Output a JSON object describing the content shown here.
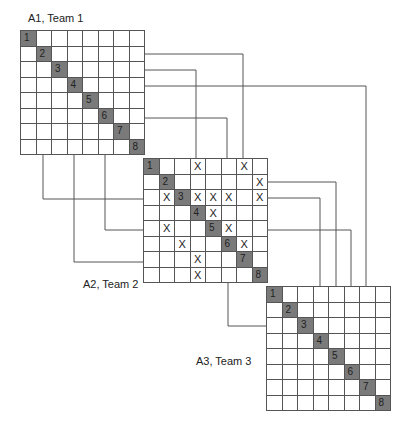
{
  "diagram": {
    "type": "coupled-dsm",
    "cell_size": 15.5,
    "matrices": [
      {
        "id": "A1",
        "label": "A1, Team 1",
        "x": 20,
        "y": 30,
        "size": 8,
        "diagonal": [
          "1",
          "2",
          "3",
          "4",
          "5",
          "6",
          "7",
          "8"
        ],
        "marks": [],
        "label_pos": {
          "x": 28,
          "y": 12
        }
      },
      {
        "id": "A2",
        "label": "A2, Team 2",
        "x": 143,
        "y": 158,
        "size": 8,
        "diagonal": [
          "1",
          "2",
          "3",
          "4",
          "5",
          "6",
          "7",
          "8"
        ],
        "marks": [
          [
            1,
            4
          ],
          [
            1,
            7
          ],
          [
            2,
            8
          ],
          [
            3,
            2
          ],
          [
            3,
            4
          ],
          [
            3,
            5
          ],
          [
            3,
            6
          ],
          [
            3,
            8
          ],
          [
            4,
            5
          ],
          [
            5,
            2
          ],
          [
            5,
            6
          ],
          [
            6,
            3
          ],
          [
            6,
            7
          ],
          [
            7,
            4
          ],
          [
            8,
            4
          ]
        ],
        "label_pos": {
          "x": 83,
          "y": 278
        }
      },
      {
        "id": "A3",
        "label": "A3, Team 3",
        "x": 266,
        "y": 286,
        "size": 8,
        "diagonal": [
          "1",
          "2",
          "3",
          "4",
          "5",
          "6",
          "7",
          "8"
        ],
        "marks": [],
        "label_pos": {
          "x": 196,
          "y": 355
        }
      }
    ],
    "mark_symbol": "X",
    "connectors": [
      [
        [
          144,
          54
        ],
        [
          243,
          54
        ],
        [
          243,
          158
        ]
      ],
      [
        [
          144,
          70
        ],
        [
          196,
          70
        ],
        [
          196,
          158
        ]
      ],
      [
        [
          144,
          86
        ],
        [
          366,
          86
        ],
        [
          366,
          286
        ]
      ],
      [
        [
          144,
          118
        ],
        [
          227,
          118
        ],
        [
          227,
          158
        ]
      ],
      [
        [
          43,
          155
        ],
        [
          43,
          199
        ],
        [
          143,
          199
        ]
      ],
      [
        [
          74,
          155
        ],
        [
          74,
          262
        ],
        [
          143,
          262
        ]
      ],
      [
        [
          105,
          155
        ],
        [
          105,
          230
        ],
        [
          143,
          230
        ]
      ],
      [
        [
          267,
          182
        ],
        [
          336,
          182
        ],
        [
          336,
          286
        ]
      ],
      [
        [
          267,
          198
        ],
        [
          320,
          198
        ],
        [
          320,
          286
        ]
      ],
      [
        [
          267,
          230
        ],
        [
          351,
          230
        ],
        [
          351,
          286
        ]
      ],
      [
        [
          228,
          282
        ],
        [
          228,
          326
        ],
        [
          266,
          326
        ]
      ]
    ],
    "colors": {
      "line": "#555555",
      "diagonal_fill": "#7a7a7a",
      "text": "#222222"
    }
  }
}
